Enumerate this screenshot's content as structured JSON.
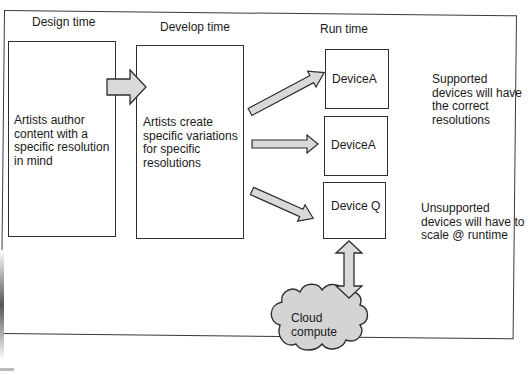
{
  "columns": {
    "design": {
      "title": "Design time"
    },
    "develop": {
      "title": "Develop time"
    },
    "run": {
      "title": "Run time"
    }
  },
  "boxes": {
    "design_box": {
      "text": "Artists author content with a specific resolution in mind"
    },
    "develop_box": {
      "text": "Artists create specific variations for specific resolutions"
    },
    "device_1": {
      "label": "DeviceA"
    },
    "device_2": {
      "label": "DeviceA"
    },
    "device_3": {
      "label": "Device Q"
    }
  },
  "notes": {
    "supported": "Supported devices will have the correct resolutions",
    "unsupported": "Unsupported devices will have to scale @ runtime"
  },
  "cloud": {
    "label_line1": "Cloud",
    "label_line2": "compute"
  },
  "colors": {
    "arrow_fill": "#d9d9d9",
    "stroke": "#2f2f2f",
    "cloud_fill": "#d4d4d4"
  }
}
